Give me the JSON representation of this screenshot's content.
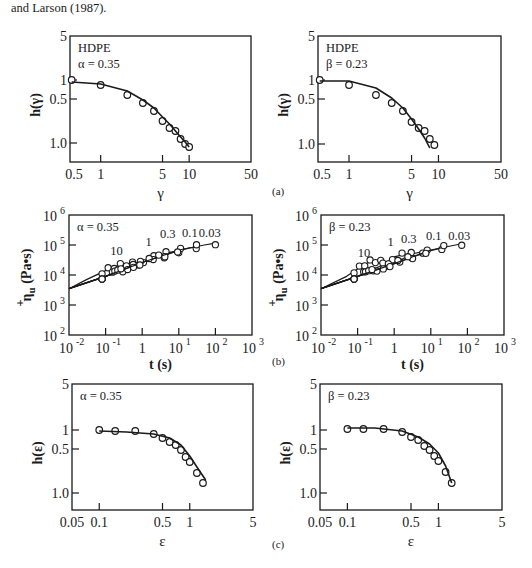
{
  "caption_top": "and Larson (1987).",
  "panel_labels": [
    "(a)",
    "(b)",
    "(c)"
  ],
  "chart_data": [
    {
      "id": "a-left",
      "type": "scatter",
      "panel": "(a)",
      "title": "",
      "annotation": [
        "HDPE",
        "α = 0.35"
      ],
      "xlabel": "γ",
      "ylabel": "h(γ)",
      "xscale": "log",
      "xlim": [
        0.45,
        50
      ],
      "xticks": [
        0.5,
        1,
        5,
        10,
        50
      ],
      "xtick_labels": [
        "0.5",
        "1",
        "5",
        "10",
        "50"
      ],
      "ytick_labels": [
        "5",
        "1",
        "0.5",
        "1.0"
      ],
      "frame": {
        "x0": 70,
        "y0": 36,
        "x1": 251,
        "y1": 162
      },
      "ytick_pos": [
        36,
        80,
        99,
        143
      ],
      "series": [
        {
          "name": "data",
          "style": "open-circle",
          "x": [
            0.47,
            1,
            2,
            3,
            4,
            5,
            6,
            7,
            8,
            9,
            10
          ],
          "y_px": [
            80,
            85,
            95,
            103,
            111,
            121,
            128,
            131,
            139,
            144,
            147
          ]
        },
        {
          "name": "model",
          "style": "line",
          "x": [
            0.47,
            1,
            2,
            3,
            4,
            5,
            6,
            7,
            8,
            9,
            10
          ],
          "y_px": [
            82,
            84,
            91,
            100,
            108,
            117,
            124,
            131,
            137,
            142,
            147
          ]
        }
      ]
    },
    {
      "id": "a-right",
      "type": "scatter",
      "panel": "(a)",
      "annotation": [
        "HDPE",
        "β = 0.23"
      ],
      "xlabel": "γ",
      "ylabel": "h(γ)",
      "xscale": "log",
      "xlim": [
        0.45,
        50
      ],
      "xticks": [
        0.5,
        1,
        5,
        10,
        50
      ],
      "xtick_labels": [
        "0.5",
        "1",
        "5",
        "10",
        "50"
      ],
      "ytick_labels": [
        "5",
        "1",
        "0.5",
        "1.0"
      ],
      "frame": {
        "x0": 318,
        "y0": 36,
        "x1": 501,
        "y1": 162
      },
      "ytick_pos": [
        36,
        80,
        99,
        144
      ],
      "series": [
        {
          "name": "data",
          "style": "open-circle",
          "x": [
            0.47,
            1,
            2,
            3,
            4,
            5,
            6,
            7,
            8,
            9
          ],
          "y_px": [
            80,
            85,
            95,
            103,
            111,
            122,
            128,
            131,
            139,
            145
          ]
        },
        {
          "name": "model",
          "style": "line",
          "x": [
            0.47,
            1,
            2,
            3,
            4,
            5,
            6,
            7,
            8
          ],
          "y_px": [
            81,
            81,
            88,
            98,
            108,
            119,
            129,
            138,
            148
          ]
        }
      ]
    },
    {
      "id": "b-left",
      "type": "scatter",
      "panel": "(b)",
      "annotation": [
        "α = 0.35"
      ],
      "curve_labels": [
        "10",
        "1",
        "0.3",
        "0.1",
        "0.03"
      ],
      "xlabel": "t (s)",
      "ylabel": "η⁺u (Pa•s)",
      "xscale": "log",
      "yscale": "log",
      "xlim": [
        0.01,
        1000
      ],
      "ylim": [
        100,
        1000000
      ],
      "xtick_labels": [
        "10⁻²",
        "10⁻¹",
        "1",
        "10¹",
        "10²",
        "10³"
      ],
      "ytick_labels": [
        "10⁶",
        "10⁵",
        "10⁴",
        "10³",
        "10²"
      ],
      "frame": {
        "x0": 69,
        "y0": 215,
        "x1": 252,
        "y1": 335
      },
      "curves": [
        {
          "rate": "10",
          "t": [
            0.01,
            0.03,
            0.1,
            0.2,
            0.4,
            0.8
          ],
          "eta": [
            3500,
            7000,
            14000,
            20000,
            23000,
            24000
          ]
        },
        {
          "rate": "1",
          "t": [
            0.01,
            0.1,
            0.5,
            1,
            2,
            4
          ],
          "eta": [
            3500,
            9000,
            18000,
            28000,
            38000,
            42000
          ]
        },
        {
          "rate": "0.3",
          "t": [
            0.01,
            0.1,
            1,
            3,
            6,
            10
          ],
          "eta": [
            3500,
            9000,
            26000,
            45000,
            58000,
            62000
          ]
        },
        {
          "rate": "0.1",
          "t": [
            0.01,
            0.1,
            1,
            10,
            20,
            30
          ],
          "eta": [
            3500,
            9000,
            26000,
            65000,
            80000,
            85000
          ]
        },
        {
          "rate": "0.03",
          "t": [
            0.01,
            0.1,
            1,
            10,
            50,
            100
          ],
          "eta": [
            3500,
            9000,
            26000,
            68000,
            100000,
            115000
          ]
        }
      ],
      "points_note": "Open circles along each rate curve from t≈0.08 s to t≈100 s, η⁺u ≈ 8×10³ to 1.2×10⁵ Pa•s"
    },
    {
      "id": "b-right",
      "type": "scatter",
      "panel": "(b)",
      "annotation": [
        "β = 0.23"
      ],
      "curve_labels": [
        "10",
        "1",
        "0.3",
        "0.1",
        "0.03"
      ],
      "xlabel": "t (s)",
      "ylabel": "η⁺u (Pa•s)",
      "xscale": "log",
      "yscale": "log",
      "xlim": [
        0.01,
        1000
      ],
      "ylim": [
        100,
        1000000
      ],
      "xtick_labels": [
        "10⁻²",
        "10⁻¹",
        "1",
        "10¹",
        "10²",
        "10³"
      ],
      "ytick_labels": [
        "10⁶",
        "10⁵",
        "10⁴",
        "10³",
        "10²"
      ],
      "frame": {
        "x0": 321,
        "y0": 215,
        "x1": 504,
        "y1": 335
      },
      "curves": [
        {
          "rate": "10",
          "t": [
            0.01,
            0.05,
            0.15,
            0.25,
            0.4,
            0.6
          ],
          "eta": [
            3500,
            9000,
            22000,
            30000,
            28000,
            22000
          ]
        },
        {
          "rate": "1",
          "t": [
            0.01,
            0.1,
            0.5,
            1,
            1.8,
            3
          ],
          "eta": [
            3500,
            9000,
            22000,
            40000,
            48000,
            42000
          ]
        },
        {
          "rate": "0.3",
          "t": [
            0.01,
            0.1,
            1,
            3,
            6
          ],
          "eta": [
            3500,
            9000,
            24000,
            50000,
            60000
          ]
        },
        {
          "rate": "0.1",
          "t": [
            0.01,
            0.1,
            1,
            10,
            20
          ],
          "eta": [
            3500,
            9000,
            24000,
            65000,
            80000
          ]
        },
        {
          "rate": "0.03",
          "t": [
            0.01,
            0.1,
            1,
            10,
            70
          ],
          "eta": [
            3500,
            9000,
            24000,
            68000,
            110000
          ]
        }
      ],
      "points_note": "Open circles along each rate curve from t≈0.08 s to t≈60 s"
    },
    {
      "id": "c-left",
      "type": "scatter",
      "panel": "(c)",
      "annotation": [
        "α = 0.35"
      ],
      "xlabel": "ε",
      "ylabel": "h(ε)",
      "xscale": "log",
      "xlim": [
        0.05,
        5
      ],
      "xtick_labels": [
        "0.05",
        "0.1",
        "0.5",
        "1",
        "5"
      ],
      "ytick_labels": [
        "5",
        "1",
        "0.5",
        "1.0"
      ],
      "frame": {
        "x0": 72,
        "y0": 384,
        "x1": 253,
        "y1": 510
      },
      "ytick_pos": [
        384,
        430,
        449,
        493
      ],
      "series": [
        {
          "name": "data",
          "style": "open-circle",
          "x": [
            0.1,
            0.15,
            0.25,
            0.4,
            0.5,
            0.6,
            0.7,
            0.8,
            0.9,
            1.0,
            1.2,
            1.4
          ],
          "y_px": [
            430,
            431,
            431,
            434,
            438,
            442,
            445,
            450,
            457,
            462,
            473,
            483
          ]
        },
        {
          "name": "model",
          "style": "line",
          "x": [
            0.1,
            0.2,
            0.4,
            0.6,
            0.8,
            1.0,
            1.2,
            1.5
          ],
          "y_px": [
            431,
            432,
            434,
            438,
            445,
            456,
            467,
            480
          ]
        }
      ]
    },
    {
      "id": "c-right",
      "type": "scatter",
      "panel": "(c)",
      "annotation": [
        "β = 0.23"
      ],
      "xlabel": "ε",
      "ylabel": "h(ε)",
      "xscale": "log",
      "xlim": [
        0.05,
        5
      ],
      "xtick_labels": [
        "0.05",
        "0.1",
        "0.5",
        "1",
        "5"
      ],
      "ytick_labels": [
        "5",
        "1",
        "0.5",
        "1.0"
      ],
      "frame": {
        "x0": 320,
        "y0": 384,
        "x1": 502,
        "y1": 510
      },
      "ytick_pos": [
        384,
        430,
        449,
        493
      ],
      "series": [
        {
          "name": "data",
          "style": "open-circle",
          "x": [
            0.1,
            0.15,
            0.25,
            0.4,
            0.5,
            0.6,
            0.7,
            0.8,
            0.9,
            1.0,
            1.2,
            1.4
          ],
          "y_px": [
            429,
            429,
            429,
            432,
            437,
            440,
            446,
            450,
            456,
            461,
            472,
            483
          ]
        },
        {
          "name": "model",
          "style": "line",
          "x": [
            0.1,
            0.2,
            0.4,
            0.6,
            0.8,
            1.0,
            1.2,
            1.4
          ],
          "y_px": [
            428,
            428,
            431,
            437,
            444,
            453,
            466,
            483
          ]
        }
      ]
    }
  ]
}
